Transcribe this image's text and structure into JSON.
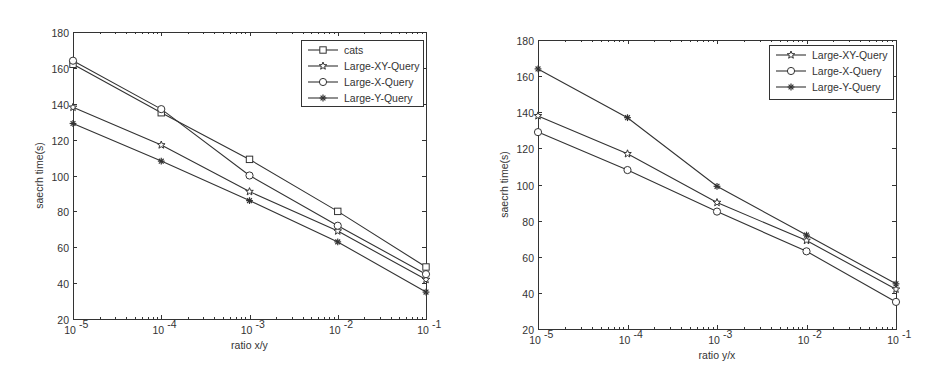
{
  "chart_data": [
    {
      "type": "line",
      "title": "",
      "xlabel": "ratio x/y",
      "ylabel": "saecrh time(s)",
      "xscale": "log",
      "x": [
        1e-05,
        0.0001,
        0.001,
        0.01,
        0.1
      ],
      "x_tick_labels": [
        "10-5",
        "10-4",
        "10-3",
        "10-2",
        "10-1"
      ],
      "y_ticks": [
        20,
        40,
        60,
        80,
        100,
        120,
        140,
        160,
        180
      ],
      "ylim": [
        20,
        180
      ],
      "grid": false,
      "legend_position": "upper right",
      "series": [
        {
          "name": "cats",
          "marker": "square",
          "values": [
            162,
            135,
            109,
            80,
            49
          ]
        },
        {
          "name": "Large-XY-Query",
          "marker": "star",
          "values": [
            138,
            117,
            91,
            69,
            42
          ]
        },
        {
          "name": "Large-X-Query",
          "marker": "circle",
          "values": [
            164,
            137,
            100,
            72,
            45
          ]
        },
        {
          "name": "Large-Y-Query",
          "marker": "asterisk",
          "values": [
            129,
            108,
            86,
            63,
            35
          ]
        }
      ]
    },
    {
      "type": "line",
      "title": "",
      "xlabel": "ratio y/x",
      "ylabel": "saecrh time(s)",
      "xscale": "log",
      "x": [
        1e-05,
        0.0001,
        0.001,
        0.01,
        0.1
      ],
      "x_tick_labels": [
        "10-5",
        "10-4",
        "10-3",
        "10-2",
        "10-1"
      ],
      "y_ticks": [
        20,
        40,
        60,
        80,
        100,
        120,
        140,
        160,
        180
      ],
      "ylim": [
        20,
        180
      ],
      "grid": false,
      "legend_position": "upper right",
      "series": [
        {
          "name": "Large-XY-Query",
          "marker": "star",
          "values": [
            138,
            117,
            90,
            69,
            42
          ]
        },
        {
          "name": "Large-X-Query",
          "marker": "circle",
          "values": [
            129,
            108,
            85,
            63,
            35
          ]
        },
        {
          "name": "Large-Y-Query",
          "marker": "asterisk",
          "values": [
            164,
            137,
            99,
            72,
            45
          ]
        }
      ]
    }
  ],
  "charts": {
    "left": {
      "xlabel": "ratio x/y",
      "ylabel": "saecrh time(s)",
      "legend": [
        "cats",
        "Large-XY-Query",
        "Large-X-Query",
        "Large-Y-Query"
      ]
    },
    "right": {
      "xlabel": "ratio y/x",
      "ylabel": "saecrh time(s)",
      "legend": [
        "Large-XY-Query",
        "Large-X-Query",
        "Large-Y-Query"
      ]
    }
  },
  "colors": {
    "line": "#333333",
    "background": "#ffffff"
  }
}
